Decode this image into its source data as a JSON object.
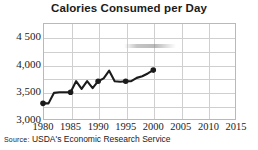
{
  "chart_data": {
    "type": "line",
    "title": "Calories Consumed per Day",
    "xlabel": "",
    "ylabel": "",
    "xlim": [
      1980,
      2015
    ],
    "ylim": [
      3000,
      4750
    ],
    "ytick_labels": [
      "3,000",
      "3,500",
      "4,000",
      "4 500"
    ],
    "ytick_values": [
      3000,
      3500,
      4000,
      4500
    ],
    "xtick_labels": [
      "1980",
      "1985",
      "1990",
      "1995",
      "2000",
      "2005",
      "2010",
      "2015"
    ],
    "xtick_values": [
      1980,
      1985,
      1990,
      1995,
      2000,
      2005,
      2010,
      2015
    ],
    "grid": true,
    "legend": "none",
    "x": [
      1980,
      1981,
      1982,
      1983,
      1984,
      1985,
      1986,
      1987,
      1988,
      1989,
      1990,
      1991,
      1992,
      1993,
      1994,
      1995,
      1996,
      1997,
      1998,
      1999,
      2000
    ],
    "values": [
      3300,
      3300,
      3490,
      3500,
      3500,
      3500,
      3700,
      3560,
      3700,
      3575,
      3700,
      3750,
      3890,
      3700,
      3690,
      3700,
      3700,
      3760,
      3790,
      3840,
      3900
    ],
    "markers_at": [
      1980,
      1985,
      1990,
      1995,
      2000
    ],
    "series_color": "#1b1b1b"
  },
  "chart": {
    "title": "Calories Consumed per Day",
    "source_prefix": "Source:",
    "source_text": "USDA's Economic Research Service"
  }
}
